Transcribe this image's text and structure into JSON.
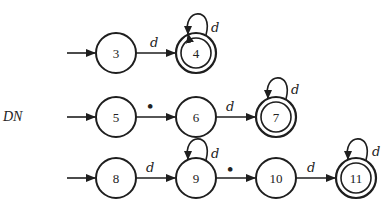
{
  "side_label": "DN",
  "colors": {
    "stroke": "#1e1e1e",
    "background": "#ffffff"
  },
  "rows": [
    {
      "name": "row-1",
      "states": [
        {
          "id": "3",
          "label": "3",
          "accepting": false,
          "start": true
        },
        {
          "id": "4",
          "label": "4",
          "accepting": true,
          "start": false,
          "self_loop": "d"
        }
      ],
      "transitions": [
        {
          "from": "3",
          "to": "4",
          "label": "d"
        }
      ]
    },
    {
      "name": "row-2",
      "states": [
        {
          "id": "5",
          "label": "5",
          "accepting": false,
          "start": true
        },
        {
          "id": "6",
          "label": "6",
          "accepting": false,
          "start": false
        },
        {
          "id": "7",
          "label": "7",
          "accepting": true,
          "start": false,
          "self_loop": "d"
        }
      ],
      "transitions": [
        {
          "from": "5",
          "to": "6",
          "label": "•"
        },
        {
          "from": "6",
          "to": "7",
          "label": "d"
        }
      ]
    },
    {
      "name": "row-3",
      "states": [
        {
          "id": "8",
          "label": "8",
          "accepting": false,
          "start": true
        },
        {
          "id": "9",
          "label": "9",
          "accepting": false,
          "start": false,
          "self_loop": "d"
        },
        {
          "id": "10",
          "label": "10",
          "accepting": false,
          "start": false
        },
        {
          "id": "11",
          "label": "11",
          "accepting": true,
          "start": false,
          "self_loop": "d"
        }
      ],
      "transitions": [
        {
          "from": "8",
          "to": "9",
          "label": "d"
        },
        {
          "from": "9",
          "to": "10",
          "label": "•"
        },
        {
          "from": "10",
          "to": "11",
          "label": "d"
        }
      ]
    }
  ]
}
